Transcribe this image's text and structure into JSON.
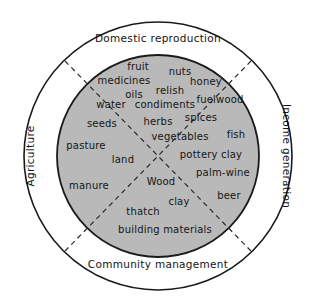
{
  "figure": {
    "type": "venn-quadrant-diagram",
    "colors": {
      "inner_fill": "#b9b9b9",
      "outer_fill": "#ffffff",
      "stroke": "#1a1a1a",
      "divider": "#2b2b2b"
    }
  },
  "ring_labels": {
    "top": "Domestic reproduction",
    "bottom": "Community management",
    "left": "Agriculture",
    "right": "Income generation"
  },
  "items": [
    {
      "label": "fruit",
      "x": 138,
      "y": 66
    },
    {
      "label": "nuts",
      "x": 180,
      "y": 71
    },
    {
      "label": "medicines",
      "x": 124,
      "y": 80
    },
    {
      "label": "honey",
      "x": 206,
      "y": 81
    },
    {
      "label": "relish",
      "x": 170,
      "y": 90
    },
    {
      "label": "oils",
      "x": 134,
      "y": 94
    },
    {
      "label": "fuelwood",
      "x": 220,
      "y": 99
    },
    {
      "label": "water",
      "x": 111,
      "y": 104
    },
    {
      "label": "condiments",
      "x": 165,
      "y": 104
    },
    {
      "label": "spices",
      "x": 201,
      "y": 117
    },
    {
      "label": "herbs",
      "x": 158,
      "y": 121
    },
    {
      "label": "seeds",
      "x": 102,
      "y": 123
    },
    {
      "label": "fish",
      "x": 236,
      "y": 134
    },
    {
      "label": "vegetables",
      "x": 180,
      "y": 136
    },
    {
      "label": "pasture",
      "x": 86,
      "y": 145
    },
    {
      "label": "pottery clay",
      "x": 211,
      "y": 154
    },
    {
      "label": "land",
      "x": 123,
      "y": 159
    },
    {
      "label": "palm-wine",
      "x": 223,
      "y": 172
    },
    {
      "label": "Wood",
      "x": 161,
      "y": 181
    },
    {
      "label": "manure",
      "x": 89,
      "y": 185
    },
    {
      "label": "beer",
      "x": 229,
      "y": 195
    },
    {
      "label": "clay",
      "x": 179,
      "y": 201
    },
    {
      "label": "thatch",
      "x": 143,
      "y": 211
    },
    {
      "label": "building materials",
      "x": 165,
      "y": 229
    }
  ]
}
